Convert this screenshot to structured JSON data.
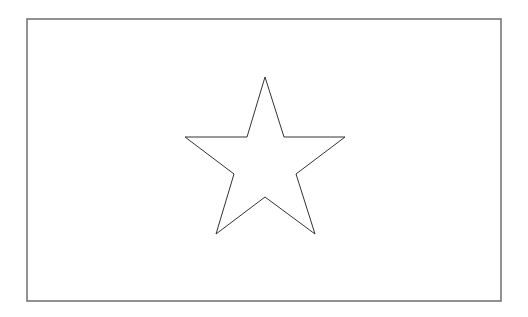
{
  "figure": {
    "background": "#ffffff",
    "frame": {
      "x": 27,
      "y": 19,
      "width": 474,
      "height": 282,
      "stroke": "#6e6e6e",
      "stroke_width": 1.5,
      "fill": "#ffffff"
    },
    "star": {
      "points": "265,77 284,137 345,137 296,174 315,234 265,197 216,234 234,174 185,137 247,137",
      "stroke": "#333333",
      "stroke_width": 1,
      "fill": "#ffffff"
    }
  }
}
